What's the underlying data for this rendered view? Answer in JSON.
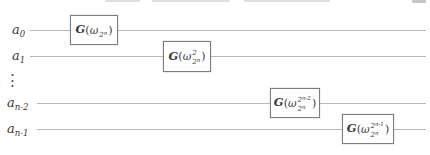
{
  "figure": {
    "type": "quantum-circuit-diagram"
  },
  "colors": {
    "background": "#ffffff",
    "wire": "#b8b8b8",
    "box_border": "#7d7d7d",
    "text": "#3a3a3a"
  },
  "ellipsis": "⋮",
  "wires": [
    {
      "label_base": "a",
      "label_sub": "0"
    },
    {
      "label_base": "a",
      "label_sub": "1"
    },
    {
      "label_base": "a",
      "label_sub": "n-2"
    },
    {
      "label_base": "a",
      "label_sub": "n-1"
    }
  ],
  "gates": [
    {
      "name": "G",
      "open": "(",
      "omega": "ω",
      "sup_base": "",
      "sup_exp": "",
      "sub_base": "2",
      "sub_exp": "n",
      "close": ")"
    },
    {
      "name": "G",
      "open": "(",
      "omega": "ω",
      "sup_base": "2",
      "sup_exp": "",
      "sub_base": "2",
      "sub_exp": "n",
      "close": ")"
    },
    {
      "name": "G",
      "open": "(",
      "omega": "ω",
      "sup_base": "2",
      "sup_exp": "n-2",
      "sub_base": "2",
      "sub_exp": "n",
      "close": ")"
    },
    {
      "name": "G",
      "open": "(",
      "omega": "ω",
      "sup_base": "2",
      "sup_exp": "n-1",
      "sub_base": "2",
      "sub_exp": "n",
      "close": ")"
    }
  ]
}
